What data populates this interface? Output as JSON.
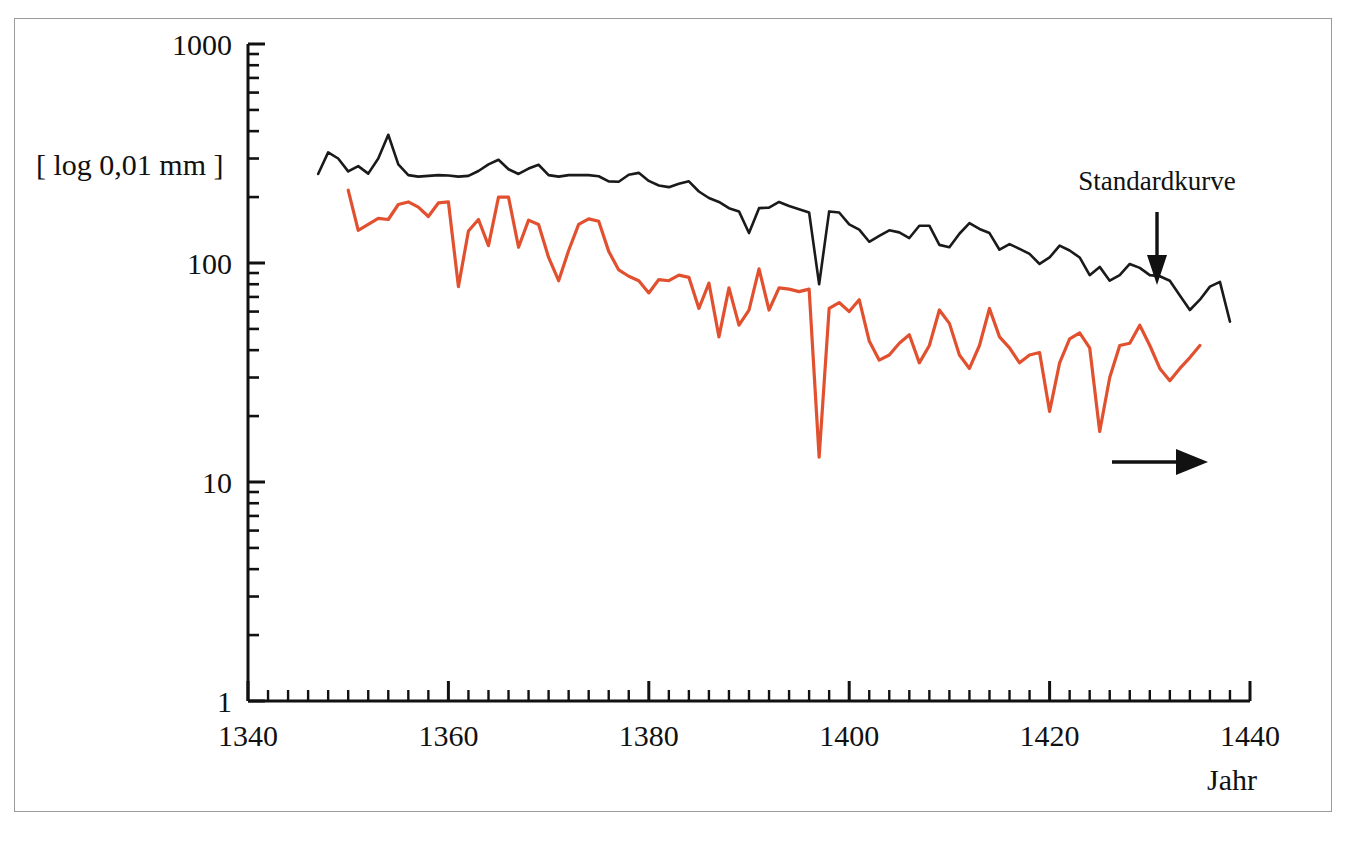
{
  "figure": {
    "background_color": "#ffffff",
    "frame_color": "#9a9a9a"
  },
  "axes": {
    "y_axis_label": "[ log 0,01 mm ]",
    "x_axis_label": "Jahr",
    "y_tick_labels": [
      "1000",
      "100",
      "10",
      "1"
    ],
    "x_tick_labels": [
      "1340",
      "1360",
      "1380",
      "1400",
      "1420",
      "1440"
    ]
  },
  "annotations": {
    "standard_curve_label": "Standardkurve",
    "down_arrow_name": "down-arrow",
    "right_arrow_name": "right-arrow"
  },
  "chart_data": {
    "type": "line",
    "title": "",
    "subtitle": "",
    "xlabel": "Jahr",
    "ylabel": "[ log 0,01 mm ]",
    "yscale": "log",
    "ylim": [
      1,
      1000
    ],
    "xlim": [
      1340,
      1440
    ],
    "y_ticks": [
      1,
      10,
      100,
      1000
    ],
    "y_minor_ticks": [
      2,
      3,
      4,
      5,
      6,
      7,
      8,
      9,
      20,
      30,
      40,
      50,
      60,
      70,
      80,
      90,
      200,
      300,
      400,
      500,
      600,
      700,
      800,
      900
    ],
    "x_ticks": [
      1340,
      1360,
      1380,
      1400,
      1420,
      1440
    ],
    "x_minor_tick_interval": 2,
    "grid": false,
    "legend_position": "none",
    "annotations": [
      {
        "text": "Standardkurve",
        "x": 1430,
        "y": 430,
        "arrow": "down",
        "target_series": "Standardkurve"
      },
      {
        "text": "",
        "x": 1428,
        "y": 12,
        "arrow": "right",
        "target_series": ""
      }
    ],
    "series": [
      {
        "name": "Standardkurve",
        "color": "#1a1a1a",
        "x": [
          1347,
          1348,
          1349,
          1350,
          1351,
          1352,
          1353,
          1354,
          1355,
          1356,
          1357,
          1358,
          1359,
          1360,
          1361,
          1362,
          1363,
          1364,
          1365,
          1366,
          1367,
          1368,
          1369,
          1370,
          1371,
          1372,
          1373,
          1374,
          1375,
          1376,
          1377,
          1378,
          1379,
          1380,
          1381,
          1382,
          1383,
          1384,
          1385,
          1386,
          1387,
          1388,
          1389,
          1390,
          1391,
          1392,
          1393,
          1394,
          1395,
          1396,
          1397,
          1398,
          1399,
          1400,
          1401,
          1402,
          1403,
          1404,
          1405,
          1406,
          1407,
          1408,
          1409,
          1410,
          1411,
          1412,
          1413,
          1414,
          1415,
          1416,
          1417,
          1418,
          1419,
          1420,
          1421,
          1422,
          1423,
          1424,
          1425,
          1426,
          1427,
          1428,
          1429,
          1430,
          1431,
          1432,
          1433,
          1434,
          1435,
          1436,
          1437,
          1438
        ],
        "values": [
          255,
          320,
          300,
          262,
          277,
          256,
          300,
          385,
          282,
          252,
          248,
          250,
          252,
          251,
          248,
          250,
          263,
          282,
          296,
          268,
          255,
          270,
          281,
          252,
          248,
          252,
          252,
          252,
          249,
          236,
          235,
          253,
          258,
          237,
          226,
          222,
          230,
          236,
          212,
          198,
          190,
          178,
          172,
          137,
          178,
          179,
          190,
          182,
          176,
          170,
          80,
          172,
          170,
          150,
          142,
          125,
          133,
          141,
          138,
          130,
          148,
          148,
          121,
          118,
          136,
          152,
          143,
          137,
          115,
          122,
          116,
          110,
          99,
          106,
          120,
          114,
          106,
          88,
          96,
          83,
          88,
          99,
          95,
          88,
          87,
          83,
          71,
          61,
          68,
          78,
          82,
          54
        ]
      },
      {
        "name": "Messkurve",
        "color": "#e2512f",
        "x": [
          1350,
          1351,
          1352,
          1353,
          1354,
          1355,
          1356,
          1357,
          1358,
          1359,
          1360,
          1361,
          1362,
          1363,
          1364,
          1365,
          1366,
          1367,
          1368,
          1369,
          1370,
          1371,
          1372,
          1373,
          1374,
          1375,
          1376,
          1377,
          1378,
          1379,
          1380,
          1381,
          1382,
          1383,
          1384,
          1385,
          1386,
          1387,
          1388,
          1389,
          1390,
          1391,
          1392,
          1393,
          1394,
          1395,
          1396,
          1397,
          1398,
          1399,
          1400,
          1401,
          1402,
          1403,
          1404,
          1405,
          1406,
          1407,
          1408,
          1409,
          1410,
          1411,
          1412,
          1413,
          1414,
          1415,
          1416,
          1417,
          1418,
          1419,
          1420,
          1421,
          1422,
          1423,
          1424,
          1425,
          1426,
          1427,
          1428,
          1429,
          1430,
          1431,
          1432,
          1433,
          1434,
          1435
        ],
        "values": [
          215,
          141,
          150,
          160,
          158,
          185,
          190,
          180,
          163,
          188,
          190,
          78,
          140,
          158,
          120,
          200,
          200,
          118,
          157,
          150,
          106,
          83,
          114,
          150,
          159,
          155,
          113,
          93,
          87,
          83,
          73,
          84,
          83,
          88,
          86,
          62,
          81,
          46,
          77,
          52,
          61,
          94,
          61,
          77,
          76,
          74,
          76,
          13,
          62,
          66,
          60,
          68,
          44,
          36,
          38,
          43,
          47,
          35,
          42,
          61,
          53,
          38,
          33,
          42,
          62,
          46,
          41,
          35,
          38,
          39,
          21,
          35,
          45,
          48,
          41,
          17,
          30,
          42,
          43,
          52,
          42,
          33,
          29,
          33,
          37,
          42
        ]
      }
    ]
  }
}
